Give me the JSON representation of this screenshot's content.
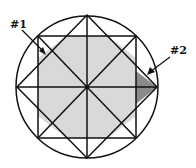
{
  "diagram": {
    "labels": {
      "region1": "#1",
      "region2": "#2"
    },
    "colors": {
      "line": "#111111",
      "light_shade": "#d9d9d9",
      "dark_shade": "#8a8a8a",
      "background": "#ffffff"
    },
    "shapes": [
      "circle",
      "square",
      "diamond",
      "diagonals",
      "axes"
    ]
  }
}
